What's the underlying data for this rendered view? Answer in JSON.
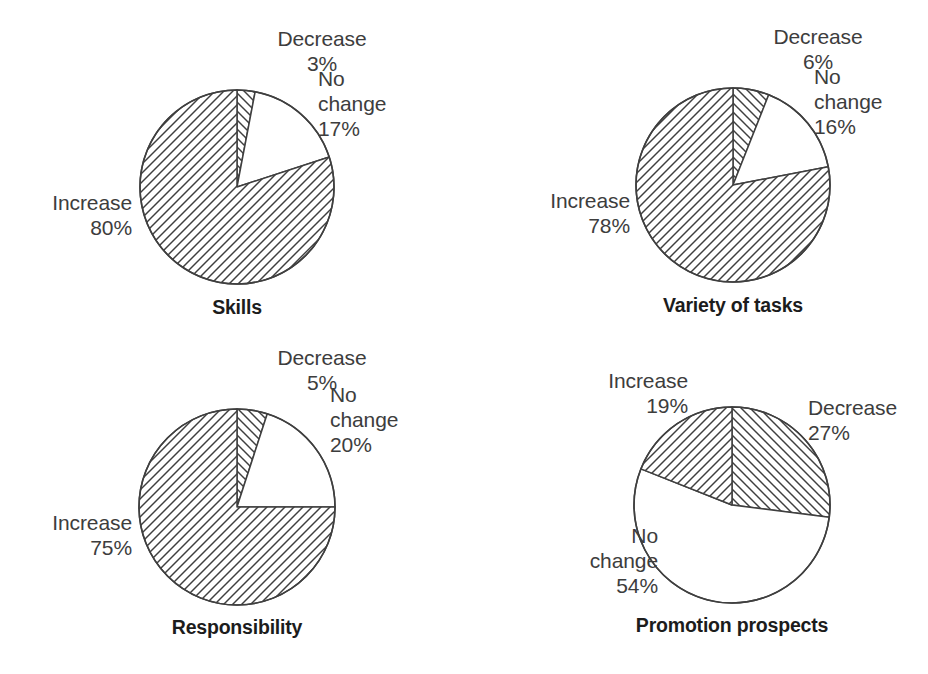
{
  "figure": {
    "background": "#ffffff",
    "stroke_color": "#3f3f3f",
    "text_color": "#3d3d3d",
    "caption_color": "#1c1c1c",
    "width": 928,
    "height": 674
  },
  "chart_data": [
    {
      "type": "pie",
      "title": "Skills",
      "categories": [
        "Decrease",
        "No change",
        "Increase"
      ],
      "values": [
        3,
        17,
        80
      ],
      "unit": "%",
      "start_angle_deg": 0,
      "direction": "clockwise",
      "fills": [
        "hatch-forward",
        "none",
        "hatch-back"
      ],
      "center": [
        237,
        187
      ],
      "radius": 97,
      "labels": [
        {
          "text": "Decrease\n3%",
          "align": "center",
          "x": 247,
          "y": 26,
          "w": 150
        },
        {
          "text": "No\nchange\n17%",
          "align": "left",
          "x": 318,
          "y": 66,
          "w": 120
        },
        {
          "text": "Increase\n80%",
          "align": "right",
          "x": -8,
          "y": 190,
          "w": 140
        }
      ]
    },
    {
      "type": "pie",
      "title": "Variety of tasks",
      "categories": [
        "Decrease",
        "No change",
        "Increase"
      ],
      "values": [
        6,
        16,
        78
      ],
      "unit": "%",
      "start_angle_deg": 0,
      "direction": "clockwise",
      "fills": [
        "hatch-forward",
        "none",
        "hatch-back"
      ],
      "center": [
        733,
        185
      ],
      "radius": 97,
      "labels": [
        {
          "text": "Decrease\n6%",
          "align": "center",
          "x": 743,
          "y": 24,
          "w": 150
        },
        {
          "text": "No\nchange\n16%",
          "align": "left",
          "x": 814,
          "y": 64,
          "w": 120
        },
        {
          "text": "Increase\n78%",
          "align": "right",
          "x": 490,
          "y": 188,
          "w": 140
        }
      ]
    },
    {
      "type": "pie",
      "title": "Responsibility",
      "categories": [
        "Decrease",
        "No change",
        "Increase"
      ],
      "values": [
        5,
        20,
        75
      ],
      "unit": "%",
      "start_angle_deg": 0,
      "direction": "clockwise",
      "fills": [
        "hatch-forward",
        "none",
        "hatch-back"
      ],
      "center": [
        237,
        507
      ],
      "radius": 98,
      "labels": [
        {
          "text": "Decrease\n5%",
          "align": "center",
          "x": 247,
          "y": 345,
          "w": 150
        },
        {
          "text": "No\nchange\n20%",
          "align": "left",
          "x": 330,
          "y": 382,
          "w": 120
        },
        {
          "text": "Increase\n75%",
          "align": "right",
          "x": -8,
          "y": 510,
          "w": 140
        }
      ]
    },
    {
      "type": "pie",
      "title": "Promotion prospects",
      "categories": [
        "Decrease",
        "No change",
        "Increase"
      ],
      "values": [
        27,
        54,
        19
      ],
      "unit": "%",
      "start_angle_deg": 0,
      "direction": "clockwise",
      "fills": [
        "hatch-forward",
        "none",
        "hatch-back"
      ],
      "center": [
        732,
        505
      ],
      "radius": 98,
      "labels": [
        {
          "text": "Increase\n19%",
          "align": "right",
          "x": 548,
          "y": 368,
          "w": 140
        },
        {
          "text": "Decrease\n27%",
          "align": "left",
          "x": 808,
          "y": 395,
          "w": 150
        },
        {
          "text": "No\nchange\n54%",
          "align": "right",
          "x": 528,
          "y": 523,
          "w": 130
        }
      ]
    }
  ],
  "captions": [
    {
      "text": "Skills",
      "cx": 237,
      "y": 296
    },
    {
      "text": "Variety of tasks",
      "cx": 733,
      "y": 294
    },
    {
      "text": "Responsibility",
      "cx": 237,
      "y": 616
    },
    {
      "text": "Promotion prospects",
      "cx": 732,
      "y": 614
    }
  ]
}
